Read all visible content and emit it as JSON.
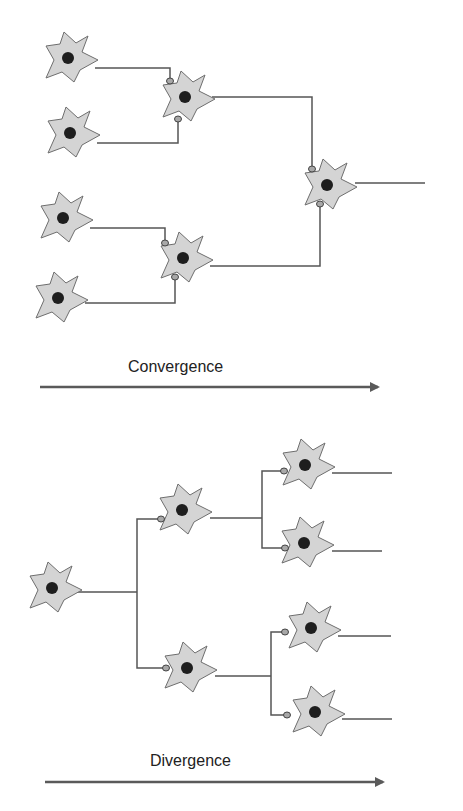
{
  "colors": {
    "cell_body": "#d4d4d4",
    "cell_outline": "#6e6e6e",
    "nucleus": "#1e1e1e",
    "axon": "#555555",
    "synapse": "#a8a8a8",
    "arrow": "#5a5a5a"
  },
  "convergence": {
    "label": "Convergence",
    "presynaptic_count": 4,
    "intermediate_count": 2,
    "output_count": 1
  },
  "divergence": {
    "label": "Divergence",
    "input_count": 1,
    "intermediate_count": 2,
    "output_count": 4
  }
}
